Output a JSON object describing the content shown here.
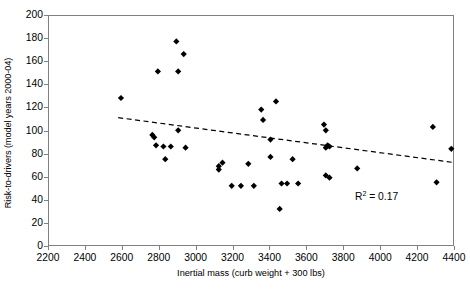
{
  "chart_data": {
    "type": "scatter",
    "title": "",
    "xlabel": "Inertial mass (curb weight + 300 lbs)",
    "ylabel": "Risk-to-drivers (model years 2000-04)",
    "xlim": [
      2200,
      4400
    ],
    "ylim": [
      0,
      200
    ],
    "xticks": [
      2200,
      2400,
      2600,
      2800,
      3000,
      3200,
      3400,
      3600,
      3800,
      4000,
      4200,
      4400
    ],
    "yticks": [
      0,
      20,
      40,
      60,
      80,
      100,
      120,
      140,
      160,
      180,
      200
    ],
    "grid": false,
    "legend": null,
    "marker": "diamond",
    "marker_color": "#000000",
    "points": [
      {
        "x": 2590,
        "y": 129
      },
      {
        "x": 2760,
        "y": 97
      },
      {
        "x": 2770,
        "y": 95
      },
      {
        "x": 2790,
        "y": 152
      },
      {
        "x": 2780,
        "y": 88
      },
      {
        "x": 2820,
        "y": 87
      },
      {
        "x": 2830,
        "y": 76
      },
      {
        "x": 2860,
        "y": 87
      },
      {
        "x": 2890,
        "y": 178
      },
      {
        "x": 2900,
        "y": 152
      },
      {
        "x": 2930,
        "y": 167
      },
      {
        "x": 2940,
        "y": 86
      },
      {
        "x": 2900,
        "y": 101
      },
      {
        "x": 3120,
        "y": 67
      },
      {
        "x": 3140,
        "y": 73
      },
      {
        "x": 3190,
        "y": 53
      },
      {
        "x": 3120,
        "y": 70
      },
      {
        "x": 3240,
        "y": 53
      },
      {
        "x": 3280,
        "y": 72
      },
      {
        "x": 3310,
        "y": 53
      },
      {
        "x": 3350,
        "y": 119
      },
      {
        "x": 3360,
        "y": 110
      },
      {
        "x": 3400,
        "y": 93
      },
      {
        "x": 3400,
        "y": 78
      },
      {
        "x": 3430,
        "y": 126
      },
      {
        "x": 3450,
        "y": 33
      },
      {
        "x": 3460,
        "y": 55
      },
      {
        "x": 3490,
        "y": 55
      },
      {
        "x": 3520,
        "y": 76
      },
      {
        "x": 3550,
        "y": 55
      },
      {
        "x": 3690,
        "y": 106
      },
      {
        "x": 3700,
        "y": 101
      },
      {
        "x": 3700,
        "y": 86
      },
      {
        "x": 3710,
        "y": 88
      },
      {
        "x": 3720,
        "y": 60
      },
      {
        "x": 3700,
        "y": 62
      },
      {
        "x": 3720,
        "y": 87
      },
      {
        "x": 3870,
        "y": 68
      },
      {
        "x": 4280,
        "y": 104
      },
      {
        "x": 4300,
        "y": 56
      },
      {
        "x": 4380,
        "y": 85
      }
    ],
    "trendline": {
      "style": "dashed",
      "color": "#000000",
      "x_start": 2575,
      "y_start": 112,
      "x_end": 4400,
      "y_end": 73
    },
    "annotations": [
      {
        "label_prefix": "R",
        "label_sup": "2",
        "label_suffix": " = 0.17",
        "x": 4120,
        "y": 28
      }
    ]
  },
  "axes": {
    "y_title": "Risk-to-drivers (model years 2000-04)",
    "x_title": "Inertial mass (curb weight + 300 lbs)",
    "y_tick_labels": [
      "200",
      "180",
      "160",
      "140",
      "120",
      "100",
      "80",
      "60",
      "40",
      "20",
      "0"
    ],
    "x_tick_labels": [
      "2200",
      "2400",
      "2600",
      "2800",
      "3000",
      "3200",
      "3400",
      "3600",
      "3800",
      "4000",
      "4200",
      "4400"
    ]
  },
  "annotation": {
    "r2_prefix": "R",
    "r2_sup": "2",
    "r2_suffix": " = 0.17"
  },
  "colors": {
    "axis": "#808080",
    "marker": "#000000",
    "trendline": "#000000",
    "background": "#ffffff"
  }
}
